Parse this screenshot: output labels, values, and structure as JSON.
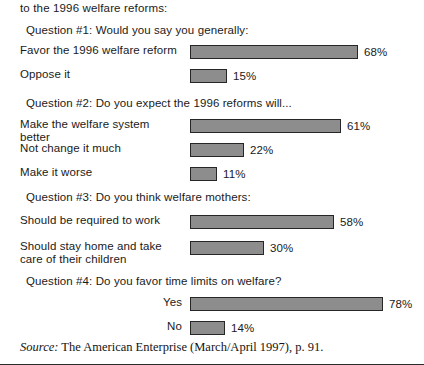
{
  "intro": "to the 1996 welfare reforms:",
  "source": {
    "label": "Source:",
    "text": "The American Enterprise (March/April 1997), p. 91."
  },
  "colors": {
    "bar_fill": "#8d8d8d",
    "bar_border": "#262626",
    "text": "#1a1a1a",
    "background": "#ffffff"
  },
  "questions": [
    {
      "heading": "Question #1: Would you say you generally:",
      "heading_top": 24,
      "rows": [
        {
          "label": "Favor the 1996 welfare reform",
          "value": 68,
          "value_label": "68%",
          "top": 44,
          "align": "left"
        },
        {
          "label": "Oppose it",
          "value": 15,
          "value_label": "15%",
          "top": 68,
          "align": "left"
        }
      ]
    },
    {
      "heading": "Question #2: Do you expect the 1996 reforms will...",
      "heading_top": 97,
      "rows": [
        {
          "label": "Make the welfare system better",
          "value": 61,
          "value_label": "61%",
          "top": 118,
          "align": "left"
        },
        {
          "label": "Not change it much",
          "value": 22,
          "value_label": "22%",
          "top": 142,
          "align": "left"
        },
        {
          "label": "Make it worse",
          "value": 11,
          "value_label": "11%",
          "top": 166,
          "align": "left"
        }
      ]
    },
    {
      "heading": "Question #3: Do you think welfare mothers:",
      "heading_top": 191,
      "rows": [
        {
          "label": "Should be required to work",
          "value": 58,
          "value_label": "58%",
          "top": 214,
          "align": "left"
        },
        {
          "label": "Should stay home and take care of their children",
          "value": 30,
          "value_label": "30%",
          "top": 240,
          "align": "left"
        }
      ]
    },
    {
      "heading": "Question #4: Do you favor time limits on welfare?",
      "heading_top": 275,
      "rows": [
        {
          "label": "Yes",
          "value": 78,
          "value_label": "78%",
          "top": 296,
          "align": "right"
        },
        {
          "label": "No",
          "value": 14,
          "value_label": "14%",
          "top": 320,
          "align": "right"
        }
      ]
    }
  ],
  "chart_data": {
    "type": "bar",
    "title": "",
    "orientation": "horizontal",
    "xlabel": "",
    "ylabel": "",
    "xlim": [
      0,
      100
    ],
    "grid": false,
    "legend": null,
    "units": "percent",
    "groups": [
      {
        "question": "Question #1: Would you say you generally:",
        "categories": [
          "Favor the 1996 welfare reform",
          "Oppose it"
        ],
        "values": [
          68,
          15
        ]
      },
      {
        "question": "Question #2: Do you expect the 1996 reforms will...",
        "categories": [
          "Make the welfare system better",
          "Not change it much",
          "Make it worse"
        ],
        "values": [
          61,
          22,
          11
        ]
      },
      {
        "question": "Question #3: Do you think welfare mothers:",
        "categories": [
          "Should be required to work",
          "Should stay home and take care of their children"
        ],
        "values": [
          58,
          30
        ]
      },
      {
        "question": "Question #4: Do you favor time limits on welfare?",
        "categories": [
          "Yes",
          "No"
        ],
        "values": [
          78,
          14
        ]
      }
    ],
    "annotations": [
      "to the 1996 welfare reforms:",
      "Source: The American Enterprise (March/April 1997), p. 91."
    ]
  }
}
